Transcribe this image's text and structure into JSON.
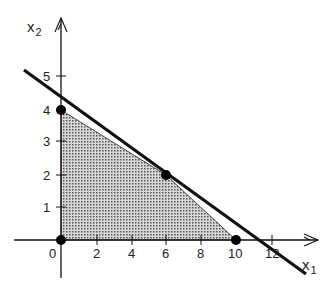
{
  "diagram": {
    "type": "linear-programming-feasible-region",
    "axes": {
      "x_label": "x",
      "x_subscript": "1",
      "y_label": "x",
      "y_subscript": "2",
      "x_ticks": [
        "2",
        "4",
        "6",
        "8",
        "10",
        "12"
      ],
      "x_tick_values": [
        2,
        4,
        6,
        8,
        10,
        12
      ],
      "y_ticks": [
        "1",
        "2",
        "3",
        "4",
        "5"
      ],
      "y_tick_values": [
        1,
        2,
        3,
        4,
        5
      ],
      "origin_label": "0"
    },
    "feasible_region": {
      "vertices": [
        [
          0,
          0
        ],
        [
          0,
          4
        ],
        [
          6,
          2
        ],
        [
          10,
          0
        ]
      ],
      "fill": "stippled gray"
    },
    "vertex_points": [
      [
        0,
        0
      ],
      [
        0,
        4
      ],
      [
        6,
        2
      ],
      [
        10,
        0
      ]
    ],
    "objective_line": {
      "description": "thick line touching the region at (6,2)",
      "approx_intercepts": {
        "x1": 11,
        "x2": 4.4
      }
    },
    "colors": {
      "ink": "#111111",
      "fill": "#9a9a9a",
      "background": "#ffffff"
    }
  }
}
